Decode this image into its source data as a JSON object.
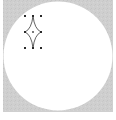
{
  "canvas": {
    "background_color": "#cfcfcf",
    "circle_color": "#ffffff"
  },
  "shape": {
    "icon": "four-point-star-icon",
    "stroke_color": "#3a3a3a",
    "handle_color": "#2a2a2a",
    "selected": true
  }
}
